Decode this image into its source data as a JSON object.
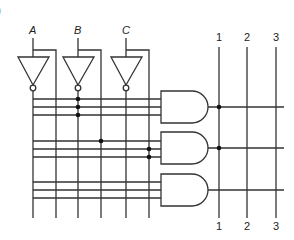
{
  "figure": {
    "corner_mark": ")"
  },
  "inputs": [
    {
      "label": "A",
      "x": 33
    },
    {
      "label": "B",
      "x": 78
    },
    {
      "label": "C",
      "x": 126
    }
  ],
  "outputs": {
    "top_labels": [
      "1",
      "2",
      "3"
    ],
    "bottom_labels": [
      "1",
      "2",
      "3"
    ],
    "x": [
      219,
      247,
      276
    ]
  },
  "and_gates": [
    {
      "name": "and-gate-1",
      "input_rows": [
        99,
        107,
        115
      ],
      "output_y": 107
    },
    {
      "name": "and-gate-2",
      "input_rows": [
        141,
        149,
        157
      ],
      "output_y": 148
    },
    {
      "name": "and-gate-3",
      "input_rows": [
        182,
        190,
        198
      ],
      "output_y": 190
    }
  ],
  "connections": {
    "grid_dots": [
      {
        "x": 78,
        "y": 99
      },
      {
        "x": 78,
        "y": 107
      },
      {
        "x": 78,
        "y": 115
      },
      {
        "x": 101,
        "y": 141
      },
      {
        "x": 149,
        "y": 149
      },
      {
        "x": 149,
        "y": 157
      }
    ],
    "output_dots": [
      {
        "x": 219,
        "y": 107
      },
      {
        "x": 219,
        "y": 148
      }
    ]
  },
  "colors": {
    "line": "#333333",
    "dot": "#111111",
    "background": "#ffffff"
  }
}
